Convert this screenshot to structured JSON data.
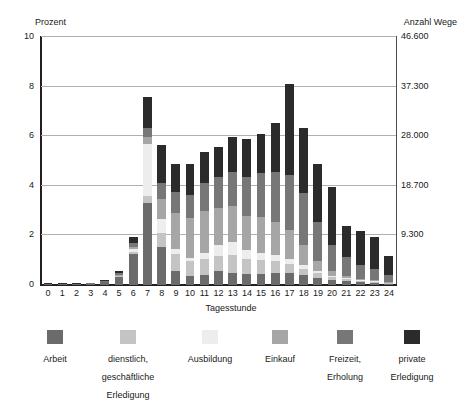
{
  "chart_data": {
    "type": "bar",
    "stacked": true,
    "title": "",
    "subtitle": "",
    "xlabel": "Tagesstunde",
    "ylabel": "Prozent",
    "ylabel_right": "Anzahl Wege",
    "grid": true,
    "legend_position": "bottom",
    "ylim": [
      0,
      10
    ],
    "yticks": [
      "0",
      "2",
      "4",
      "6",
      "8",
      "10"
    ],
    "ytick_values": [
      0,
      2,
      4,
      6,
      8,
      10
    ],
    "yticks_right": [
      "9.300",
      "18.700",
      "28.000",
      "37.300",
      "46.600"
    ],
    "ytick_right_values": [
      2,
      4,
      6,
      8,
      10
    ],
    "categories": [
      "0",
      "1",
      "2",
      "3",
      "4",
      "5",
      "6",
      "7",
      "8",
      "9",
      "10",
      "11",
      "12",
      "13",
      "14",
      "15",
      "16",
      "17",
      "18",
      "19",
      "20",
      "21",
      "22",
      "23",
      "24"
    ],
    "series": [
      {
        "name": "Arbeit",
        "color": "#6b6b6b",
        "values": [
          0.02,
          0.02,
          0.02,
          0.05,
          0.12,
          0.32,
          1.25,
          3.3,
          1.55,
          0.55,
          0.35,
          0.4,
          0.55,
          0.5,
          0.45,
          0.45,
          0.5,
          0.5,
          0.4,
          0.3,
          0.22,
          0.15,
          0.12,
          0.1,
          0.05
        ]
      },
      {
        "name": "dienstlich, geschäftliche Erledigung",
        "color": "#c4c4c4",
        "values": [
          0.0,
          0.0,
          0.0,
          0.0,
          0.0,
          0.02,
          0.1,
          0.3,
          0.55,
          0.7,
          0.6,
          0.65,
          0.62,
          0.7,
          0.6,
          0.55,
          0.45,
          0.35,
          0.25,
          0.18,
          0.1,
          0.08,
          0.05,
          0.04,
          0.02
        ]
      },
      {
        "name": "Ausbildung",
        "color": "#ededed",
        "values": [
          0.0,
          0.0,
          0.0,
          0.0,
          0.0,
          0.02,
          0.12,
          2.1,
          0.55,
          0.2,
          0.15,
          0.25,
          0.45,
          0.55,
          0.35,
          0.3,
          0.25,
          0.2,
          0.15,
          0.1,
          0.05,
          0.04,
          0.03,
          0.02,
          0.01
        ]
      },
      {
        "name": "Einkauf",
        "color": "#a6a6a6",
        "values": [
          0.0,
          0.0,
          0.0,
          0.0,
          0.0,
          0.02,
          0.08,
          0.25,
          0.8,
          1.45,
          1.6,
          1.7,
          1.5,
          1.45,
          1.4,
          1.45,
          1.35,
          1.15,
          0.8,
          0.4,
          0.18,
          0.1,
          0.06,
          0.04,
          0.02
        ]
      },
      {
        "name": "Freizeit, Erholung",
        "color": "#777777",
        "values": [
          0.02,
          0.02,
          0.02,
          0.02,
          0.04,
          0.08,
          0.15,
          0.4,
          0.65,
          0.85,
          0.95,
          1.1,
          1.25,
          1.35,
          1.55,
          1.75,
          2.0,
          2.25,
          2.1,
          1.55,
          1.05,
          0.75,
          0.55,
          0.45,
          0.3
        ]
      },
      {
        "name": "private Erledigung",
        "color": "#2b2b2b",
        "values": [
          0.02,
          0.02,
          0.02,
          0.02,
          0.04,
          0.08,
          0.25,
          1.25,
          1.55,
          1.15,
          1.25,
          1.25,
          1.2,
          1.4,
          1.55,
          1.6,
          2.0,
          3.65,
          2.65,
          2.35,
          2.35,
          1.25,
          1.35,
          1.3,
          0.75
        ]
      }
    ],
    "totals": [
      0.06,
      0.06,
      0.06,
      0.09,
      0.2,
      0.54,
      1.95,
      7.6,
      5.65,
      4.9,
      4.9,
      5.35,
      5.57,
      5.95,
      5.9,
      6.1,
      6.55,
      8.1,
      6.35,
      4.88,
      3.95,
      2.37,
      2.16,
      1.95,
      1.15
    ]
  },
  "legend": {
    "items": [
      {
        "label": "Arbeit",
        "color": "#6b6b6b"
      },
      {
        "label": "dienstlich,\ngeschäftliche\nErledigung",
        "color": "#c4c4c4"
      },
      {
        "label": "Ausbildung",
        "color": "#ededed"
      },
      {
        "label": "Einkauf",
        "color": "#a6a6a6"
      },
      {
        "label": "Freizeit,\nErholung",
        "color": "#777777"
      },
      {
        "label": "private\nErledigung",
        "color": "#2b2b2b"
      }
    ]
  }
}
